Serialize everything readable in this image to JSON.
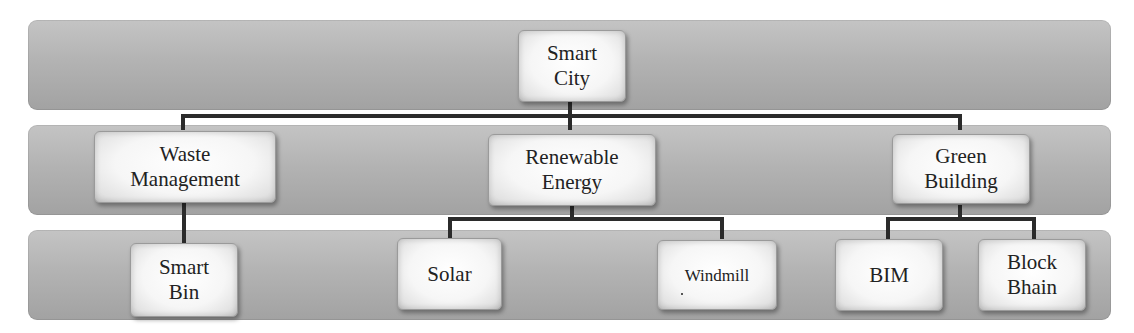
{
  "diagram": {
    "type": "hierarchy",
    "levels": 3,
    "root": {
      "label": "Smart\nCity"
    },
    "level2": [
      {
        "label": "Waste\nManagement",
        "children": [
          "Smart\nBin"
        ]
      },
      {
        "label": "Renewable\nEnergy",
        "children": [
          "Solar",
          "Windmill"
        ]
      },
      {
        "label": "Green\nBuilding",
        "children": [
          "BIM",
          "Block\nBhain"
        ]
      }
    ],
    "level3": [
      {
        "label": "Smart\nBin"
      },
      {
        "label": "Solar"
      },
      {
        "label": "Windmill"
      },
      {
        "label": "BIM"
      },
      {
        "label": "Block\nBhain"
      }
    ],
    "colors": {
      "band": "#b3b3b3",
      "node": "#f6f6f6",
      "connector": "#2b2b2b",
      "text": "#222222"
    }
  }
}
